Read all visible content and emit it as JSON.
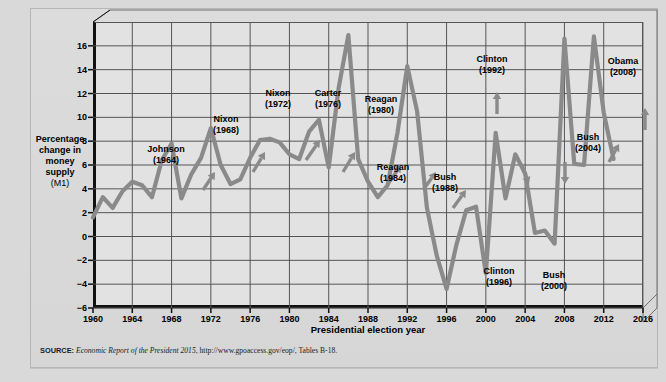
{
  "figure": {
    "background_color": "#d9d9d9",
    "plot_background_color": "#e2e2e2",
    "line_color": "#8a8a8a",
    "axis_color": "#111111",
    "grid_color": "#555555"
  },
  "source": {
    "label": "SOURCE:",
    "italic_title": "Economic Report of the President 2015",
    "rest": ", http://www.gpoaccess.gov/eop/, Tables B-18."
  },
  "axis": {
    "ylabel_line1": "Percentage",
    "ylabel_line2": "change in",
    "ylabel_line3": "money",
    "ylabel_line4": "supply",
    "ylabel_line5": "(M1)",
    "xlabel": "Presidential election year"
  },
  "chart_data": {
    "type": "line",
    "title": "",
    "xlabel": "Presidential election year",
    "ylabel": "Percentage change in money supply (M1)",
    "xlim": [
      1960,
      2016
    ],
    "ylim": [
      -6,
      18
    ],
    "yticks": [
      16,
      14,
      12,
      10,
      8,
      6,
      4,
      2,
      0,
      -2,
      -4,
      -6
    ],
    "ytick_labels": [
      "16",
      "14",
      "12",
      "10",
      "8",
      "6",
      "4",
      "2",
      "0",
      "−2",
      "−4",
      "−6"
    ],
    "xticks": [
      1960,
      1964,
      1968,
      1972,
      1976,
      1980,
      1984,
      1988,
      1992,
      1996,
      2000,
      2004,
      2008,
      2012,
      2016
    ],
    "xtick_labels": [
      "1960",
      "1964",
      "1968",
      "1972",
      "1976",
      "1980",
      "1984",
      "1988",
      "1992",
      "1996",
      "2000",
      "2004",
      "2008",
      "2012",
      "2016"
    ],
    "grid": true,
    "legend": "none",
    "series": [
      {
        "name": "Percentage change in money supply (M1)",
        "color": "#8a8a8a",
        "x": [
          1960,
          1961,
          1962,
          1963,
          1964,
          1965,
          1966,
          1967,
          1968,
          1969,
          1970,
          1971,
          1972,
          1973,
          1974,
          1975,
          1976,
          1977,
          1978,
          1979,
          1980,
          1981,
          1982,
          1983,
          1984,
          1985,
          1986,
          1987,
          1988,
          1989,
          1990,
          1991,
          1992,
          1993,
          1994,
          1995,
          1996,
          1997,
          1998,
          1999,
          2000,
          2001,
          2002,
          2003,
          2004,
          2005,
          2006,
          2007,
          2008,
          2009,
          2010,
          2011,
          2012,
          2013
        ],
        "values": [
          1.6,
          3.3,
          2.4,
          3.8,
          4.6,
          4.3,
          3.3,
          6.4,
          7.8,
          3.2,
          5.2,
          6.6,
          9.1,
          6.0,
          4.4,
          4.8,
          6.6,
          8.1,
          8.2,
          7.9,
          6.9,
          6.5,
          8.8,
          9.8,
          5.8,
          12.4,
          16.9,
          6.5,
          4.6,
          3.3,
          4.3,
          8.7,
          14.3,
          10.5,
          2.4,
          -1.6,
          -4.4,
          -0.7,
          2.2,
          2.5,
          -3.1,
          8.7,
          3.2,
          6.9,
          5.3,
          0.3,
          0.5,
          -0.6,
          16.6,
          6.1,
          6.0,
          16.8,
          10.4,
          6.5
        ]
      }
    ],
    "annotations": [
      {
        "text_line1": "Johnson",
        "text_line2": "(1964)",
        "year": 1964,
        "arrow": "up"
      },
      {
        "text_line1": "Nixon",
        "text_line2": "(1968)",
        "year": 1968,
        "arrow": "up"
      },
      {
        "text_line1": "Nixon",
        "text_line2": "(1972)",
        "year": 1972,
        "arrow": "up"
      },
      {
        "text_line1": "Carter",
        "text_line2": "(1976)",
        "year": 1976,
        "arrow": "up"
      },
      {
        "text_line1": "Reagan",
        "text_line2": "(1980)",
        "year": 1980,
        "arrow": "up"
      },
      {
        "text_line1": "Reagan",
        "text_line2": "(1984)",
        "year": 1984,
        "arrow": "up"
      },
      {
        "text_line1": "Bush",
        "text_line2": "(1988)",
        "year": 1988,
        "arrow": "up"
      },
      {
        "text_line1": "Clinton",
        "text_line2": "(1992)",
        "year": 1992,
        "arrow": "up"
      },
      {
        "text_line1": "Clinton",
        "text_line2": "(1996)",
        "year": 1996,
        "arrow": "down"
      },
      {
        "text_line1": "Bush",
        "text_line2": "(2000)",
        "year": 2000,
        "arrow": "down"
      },
      {
        "text_line1": "Bush",
        "text_line2": "(2004)",
        "year": 2004,
        "arrow": "up"
      },
      {
        "text_line1": "Obama",
        "text_line2": "(2008)",
        "year": 2008,
        "arrow": "up"
      },
      {
        "text_line1": "Obama",
        "text_line2": "(2012)",
        "year": 2012,
        "arrow": "down"
      }
    ]
  }
}
